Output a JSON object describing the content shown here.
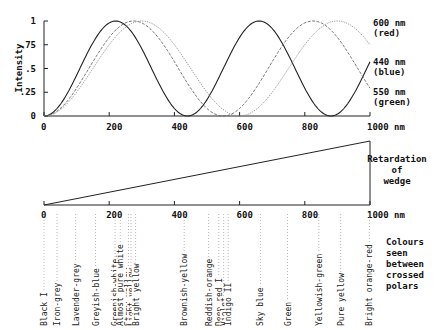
{
  "chart_data": [
    {
      "type": "line",
      "title": "",
      "ylabel": "Intensity",
      "xlabel": "",
      "xlim": [
        0,
        1000
      ],
      "ylim": [
        0,
        1
      ],
      "x_ticks": [
        "0",
        "200",
        "400",
        "600",
        "800",
        "1000 nm"
      ],
      "y_ticks": [
        "0",
        ".25",
        ".5",
        ".75",
        "1"
      ],
      "series": [
        {
          "name": "440 nm (blue)",
          "label_line1": "440 nm",
          "label_line2": "(blue)",
          "wavelength": 440,
          "style": "solid",
          "color": "#222222"
        },
        {
          "name": "550 nm (green)",
          "label_line1": "550 nm",
          "label_line2": "(green)",
          "wavelength": 550,
          "style": "dashed",
          "color": "#666666"
        },
        {
          "name": "600 nm (red)",
          "label_line1": "600 nm",
          "label_line2": "(red)",
          "wavelength": 600,
          "style": "dotted",
          "color": "#888888"
        }
      ],
      "formula": "I = sin^2(pi * retardation / wavelength)"
    },
    {
      "type": "line",
      "title": "Retardation of wedge",
      "title_lines": [
        "Retardation",
        "of",
        "wedge"
      ],
      "xlim": [
        0,
        1000
      ],
      "x_ticks": [
        "0",
        "200",
        "400",
        "600",
        "800",
        "1000 nm"
      ],
      "values": {
        "x": [
          0,
          1000
        ],
        "y": [
          0,
          1000
        ]
      }
    }
  ],
  "colours": {
    "caption_lines": [
      "Colours",
      "seen",
      "between",
      "crossed",
      "polars"
    ],
    "items": [
      {
        "name": "Black I",
        "r": 0
      },
      {
        "name": "Iron-grey",
        "r": 40
      },
      {
        "name": "Lavender-grey",
        "r": 97
      },
      {
        "name": "Greyish-blue",
        "r": 158
      },
      {
        "name": "Greenish-white",
        "r": 218
      },
      {
        "name": "Almost pure white",
        "r": 234
      },
      {
        "name": "Straw yellow",
        "r": 259
      },
      {
        "name": "Light yellow",
        "r": 267
      },
      {
        "name": "Bright yellow",
        "r": 281
      },
      {
        "name": "Brownish-yellow",
        "r": 430
      },
      {
        "name": "Reddish-orange",
        "r": 505
      },
      {
        "name": "Deep red I",
        "r": 536
      },
      {
        "name": "Violet",
        "r": 551
      },
      {
        "name": "Indigo II",
        "r": 565
      },
      {
        "name": "Sky blue",
        "r": 664
      },
      {
        "name": "Green",
        "r": 747
      },
      {
        "name": "Yellowish-green",
        "r": 843
      },
      {
        "name": "Pure yellow",
        "r": 910
      },
      {
        "name": "Bright orange-red",
        "r": 998
      }
    ]
  }
}
